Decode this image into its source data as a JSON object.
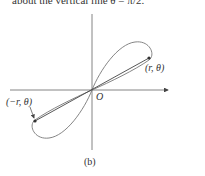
{
  "top_text": "about the vertical line θ = π/2.",
  "diagram": {
    "origin_label": "O",
    "point_label": "(r, θ)",
    "neg_point_label": "(−r, θ)",
    "subfigure_label": "(b)"
  },
  "colors": {
    "axis": "#555555",
    "curve": "#777777",
    "line": "#444444"
  }
}
